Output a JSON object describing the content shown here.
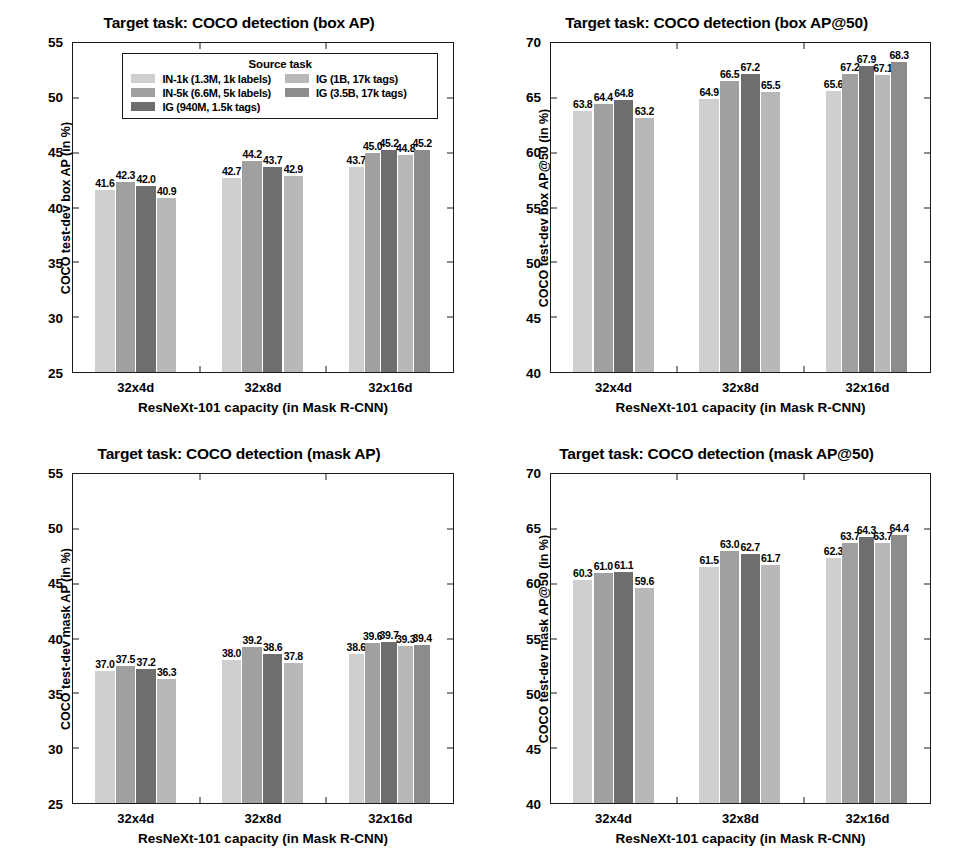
{
  "figure": {
    "background": "#ffffff",
    "categories": [
      "32x4d",
      "32x8d",
      "32x16d"
    ],
    "xlabel": "ResNeXt-101 capacity (in Mask R-CNN)",
    "series_names": [
      "IN-1k (1.3M, 1k labels)",
      "IN-5k (6.6M, 5k labels)",
      "IG (940M, 1.5k tags)",
      "IG (1B, 17k tags)",
      "IG (3.5B, 17k tags)"
    ],
    "series_colors": [
      "#cfcfcf",
      "#a0a0a0",
      "#6e6e6e",
      "#b8b8b8",
      "#8c8c8c"
    ]
  },
  "legend": {
    "title": "Source task",
    "column_left": [
      {
        "label": "IN-1k (1.3M, 1k labels)",
        "color": "#cfcfcf"
      },
      {
        "label": "IN-5k (6.6M, 5k labels)",
        "color": "#a0a0a0"
      },
      {
        "label": "IG (940M, 1.5k tags)",
        "color": "#6e6e6e"
      }
    ],
    "column_right": [
      {
        "label": "IG (1B, 17k tags)",
        "color": "#b8b8b8"
      },
      {
        "label": "IG (3.5B, 17k tags)",
        "color": "#8c8c8c"
      }
    ]
  },
  "chart_data": [
    {
      "id": "box-ap",
      "type": "bar",
      "title": "Target task: COCO detection (box AP)",
      "xlabel": "ResNeXt-101 capacity (in Mask R-CNN)",
      "ylabel": "COCO test-dev box AP (in %)",
      "categories": [
        "32x4d",
        "32x8d",
        "32x16d"
      ],
      "ylim": [
        25,
        55
      ],
      "yticks": [
        25,
        30,
        35,
        40,
        45,
        50,
        55
      ],
      "grid": false,
      "legend_position": "upper-center-inside",
      "series": [
        {
          "name": "IN-1k (1.3M, 1k labels)",
          "color": "#cfcfcf",
          "values": [
            41.6,
            42.7,
            43.7
          ]
        },
        {
          "name": "IN-5k (6.6M, 5k labels)",
          "color": "#a0a0a0",
          "values": [
            42.3,
            44.2,
            45.0
          ]
        },
        {
          "name": "IG (940M, 1.5k tags)",
          "color": "#6e6e6e",
          "values": [
            42.0,
            43.7,
            45.2
          ]
        },
        {
          "name": "IG (1B, 17k tags)",
          "color": "#b8b8b8",
          "values": [
            40.9,
            42.9,
            44.8
          ]
        },
        {
          "name": "IG (3.5B, 17k tags)",
          "color": "#8c8c8c",
          "values": [
            null,
            null,
            45.2
          ]
        }
      ]
    },
    {
      "id": "box-ap50",
      "type": "bar",
      "title": "Target task: COCO detection (box AP@50)",
      "xlabel": "ResNeXt-101 capacity (in Mask R-CNN)",
      "ylabel": "COCO test-dev box AP@50 (in %)",
      "categories": [
        "32x4d",
        "32x8d",
        "32x16d"
      ],
      "ylim": [
        40,
        70
      ],
      "yticks": [
        40,
        45,
        50,
        55,
        60,
        65,
        70
      ],
      "grid": false,
      "legend_position": "none",
      "series": [
        {
          "name": "IN-1k (1.3M, 1k labels)",
          "color": "#cfcfcf",
          "values": [
            63.8,
            64.9,
            65.6
          ]
        },
        {
          "name": "IN-5k (6.6M, 5k labels)",
          "color": "#a0a0a0",
          "values": [
            64.4,
            66.5,
            67.2
          ]
        },
        {
          "name": "IG (940M, 1.5k tags)",
          "color": "#6e6e6e",
          "values": [
            64.8,
            67.2,
            67.9
          ]
        },
        {
          "name": "IG (1B, 17k tags)",
          "color": "#b8b8b8",
          "values": [
            63.2,
            65.5,
            67.1
          ]
        },
        {
          "name": "IG (3.5B, 17k tags)",
          "color": "#8c8c8c",
          "values": [
            null,
            null,
            68.3
          ]
        }
      ]
    },
    {
      "id": "mask-ap",
      "type": "bar",
      "title": "Target task: COCO detection (mask AP)",
      "xlabel": "ResNeXt-101 capacity (in Mask R-CNN)",
      "ylabel": "COCO test-dev mask AP (in %)",
      "categories": [
        "32x4d",
        "32x8d",
        "32x16d"
      ],
      "ylim": [
        25,
        55
      ],
      "yticks": [
        25,
        30,
        35,
        40,
        45,
        50,
        55
      ],
      "grid": false,
      "legend_position": "none",
      "series": [
        {
          "name": "IN-1k (1.3M, 1k labels)",
          "color": "#cfcfcf",
          "values": [
            37.0,
            38.0,
            38.6
          ]
        },
        {
          "name": "IN-5k (6.6M, 5k labels)",
          "color": "#a0a0a0",
          "values": [
            37.5,
            39.2,
            39.6
          ]
        },
        {
          "name": "IG (940M, 1.5k tags)",
          "color": "#6e6e6e",
          "values": [
            37.2,
            38.6,
            39.7
          ]
        },
        {
          "name": "IG (1B, 17k tags)",
          "color": "#b8b8b8",
          "values": [
            36.3,
            37.8,
            39.3
          ]
        },
        {
          "name": "IG (3.5B, 17k tags)",
          "color": "#8c8c8c",
          "values": [
            null,
            null,
            39.4
          ]
        }
      ]
    },
    {
      "id": "mask-ap50",
      "type": "bar",
      "title": "Target task: COCO detection (mask AP@50)",
      "xlabel": "ResNeXt-101 capacity (in Mask R-CNN)",
      "ylabel": "COCO test-dev mask AP@50 (in %)",
      "categories": [
        "32x4d",
        "32x8d",
        "32x16d"
      ],
      "ylim": [
        40,
        70
      ],
      "yticks": [
        40,
        45,
        50,
        55,
        60,
        65,
        70
      ],
      "grid": false,
      "legend_position": "none",
      "series": [
        {
          "name": "IN-1k (1.3M, 1k labels)",
          "color": "#cfcfcf",
          "values": [
            60.3,
            61.5,
            62.3
          ]
        },
        {
          "name": "IN-5k (6.6M, 5k labels)",
          "color": "#a0a0a0",
          "values": [
            61.0,
            63.0,
            63.7
          ]
        },
        {
          "name": "IG (940M, 1.5k tags)",
          "color": "#6e6e6e",
          "values": [
            61.1,
            62.7,
            64.3
          ]
        },
        {
          "name": "IG (1B, 17k tags)",
          "color": "#b8b8b8",
          "values": [
            59.6,
            61.7,
            63.7
          ]
        },
        {
          "name": "IG (3.5B, 17k tags)",
          "color": "#8c8c8c",
          "values": [
            null,
            null,
            64.4
          ]
        }
      ]
    }
  ]
}
